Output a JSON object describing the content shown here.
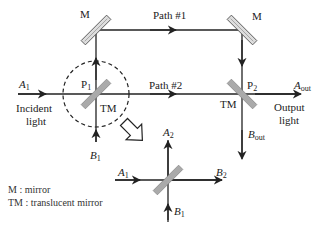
{
  "diagram": {
    "type": "Mach-Zehnder interferometer",
    "labels": {
      "mirror_top_left": "M",
      "mirror_top_right": "M",
      "path1": "Path #1",
      "path2": "Path #2",
      "A1": {
        "main": "A",
        "sub": "1"
      },
      "incident": "Incident",
      "incident2": "light",
      "P1": {
        "main": "P",
        "sub": "1"
      },
      "TM_left": "TM",
      "B1": {
        "main": "B",
        "sub": "1"
      },
      "P2": {
        "main": "P",
        "sub": "2"
      },
      "TM_right": "TM",
      "Aout": {
        "main": "A",
        "sub": "out"
      },
      "output": "Output",
      "output2": "light",
      "Bout": {
        "main": "B",
        "sub": "out"
      },
      "inset_A1": {
        "main": "A",
        "sub": "1"
      },
      "inset_A2": {
        "main": "A",
        "sub": "2"
      },
      "inset_B1": {
        "main": "B",
        "sub": "1"
      },
      "inset_B2": {
        "main": "B",
        "sub": "2"
      }
    },
    "legend": [
      "M : mirror",
      "TM : translucent mirror"
    ],
    "colors": {
      "line": "#222222",
      "mirror_fill": "#bbbbbb",
      "mirror_stroke": "#555555"
    }
  }
}
